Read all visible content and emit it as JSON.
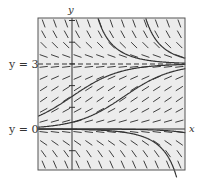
{
  "figure": {
    "type": "slope-field",
    "labels": {
      "y_axis": "y",
      "x_axis": "x",
      "equilibrium_upper": "y = 3",
      "equilibrium_lower": "y = 0"
    },
    "colors": {
      "background": "#ffffff",
      "field_background": "#ececec",
      "frame": "#555555",
      "marks": "#2a2a2a",
      "curves": "#333333",
      "dashed_line": "#333333"
    },
    "domain": {
      "xmin": -1.55,
      "xmax": 5.2,
      "ymin": -1.9,
      "ymax": 5.1
    },
    "equilibria": [
      0,
      3
    ],
    "grid": {
      "cols": 13,
      "rows": 14
    },
    "solution_curves": [
      {
        "kind": "logistic-rise",
        "shift": 0.0
      },
      {
        "kind": "logistic-rise",
        "shift": 2.2
      },
      {
        "kind": "decay-to-3-from-above",
        "shift": 0.0
      },
      {
        "kind": "decay-to-3-from-above",
        "shift": 1.6
      },
      {
        "kind": "diverge-below-0",
        "shift": 0.0
      },
      {
        "kind": "diverge-below-0",
        "shift": 2.7
      }
    ]
  }
}
